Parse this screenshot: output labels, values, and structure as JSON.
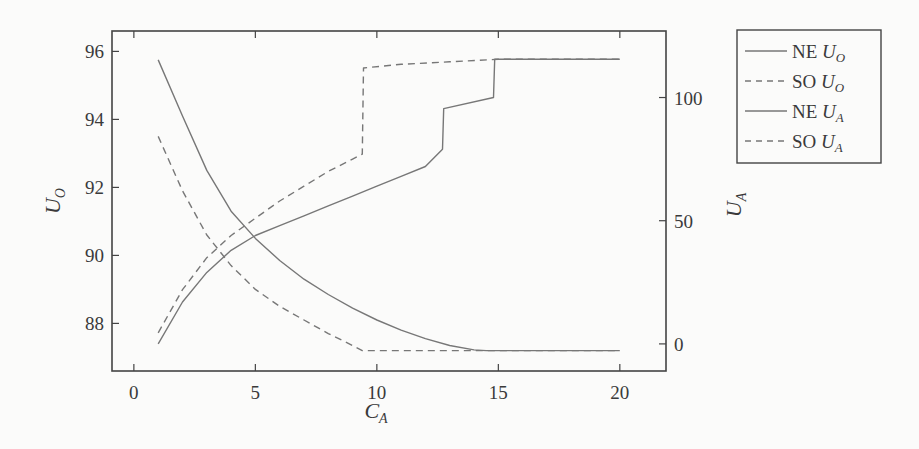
{
  "chart_data": {
    "type": "line",
    "title": "",
    "xlabel": "C_A",
    "ylabel_left": "U_O",
    "ylabel_right": "U_A",
    "xlim": [
      -0.9,
      21.9
    ],
    "ylim_left": [
      86.6,
      96.6
    ],
    "ylim_right": [
      -11,
      127
    ],
    "xticks": [
      0,
      5,
      10,
      15,
      20
    ],
    "yticks_left": [
      88,
      90,
      92,
      94,
      96
    ],
    "yticks_right": [
      0,
      50,
      100
    ],
    "grid": false,
    "legend_position": "outside-right-top",
    "series": [
      {
        "name": "NE U_O",
        "axis": "left",
        "style": "solid",
        "x": [
          1,
          2,
          3,
          4,
          5,
          6,
          7,
          8,
          9,
          10,
          11,
          12,
          13,
          14,
          14.5,
          15,
          16,
          17,
          18,
          19,
          20
        ],
        "y": [
          95.75,
          94.1,
          92.5,
          91.3,
          90.5,
          89.85,
          89.3,
          88.85,
          88.45,
          88.1,
          87.8,
          87.55,
          87.35,
          87.22,
          87.2,
          87.2,
          87.2,
          87.2,
          87.2,
          87.2,
          87.2
        ]
      },
      {
        "name": "SO U_O",
        "axis": "left",
        "style": "dashed",
        "x": [
          1,
          2,
          3,
          4,
          5,
          6,
          7,
          8,
          9,
          9.4,
          10,
          12,
          14,
          15,
          20
        ],
        "y": [
          93.5,
          91.9,
          90.6,
          89.7,
          89.0,
          88.5,
          88.1,
          87.7,
          87.35,
          87.2,
          87.2,
          87.2,
          87.2,
          87.2,
          87.2
        ]
      },
      {
        "name": "NE U_A",
        "axis": "right",
        "style": "solid",
        "x": [
          1,
          2,
          3,
          4,
          5,
          6,
          7,
          8,
          9,
          10,
          11,
          12,
          12.7,
          12.75,
          14.8,
          14.85,
          15,
          20
        ],
        "y": [
          0,
          17,
          29,
          38,
          44,
          48,
          52,
          56,
          60,
          64,
          68,
          72,
          79,
          95.5,
          100,
          115.5,
          115.5,
          115.5
        ]
      },
      {
        "name": "SO U_A",
        "axis": "right",
        "style": "dashed",
        "x": [
          1,
          2,
          3,
          4,
          5,
          6,
          7,
          8,
          9,
          9.4,
          9.45,
          11,
          13,
          15,
          20
        ],
        "y": [
          4.5,
          22,
          35,
          44,
          51,
          58,
          64,
          70,
          75,
          77,
          112,
          113.5,
          114.5,
          115.5,
          115.5
        ]
      }
    ]
  },
  "legend": {
    "items": [
      {
        "label_prefix": "NE ",
        "label_symbol": "U",
        "label_sub": "O",
        "style": "solid"
      },
      {
        "label_prefix": "SO ",
        "label_symbol": "U",
        "label_sub": "O",
        "style": "dashed"
      },
      {
        "label_prefix": "NE ",
        "label_symbol": "U",
        "label_sub": "A",
        "style": "solid"
      },
      {
        "label_prefix": "SO ",
        "label_symbol": "U",
        "label_sub": "A",
        "style": "dashed"
      }
    ]
  },
  "axes": {
    "x_label_main": "C",
    "x_label_sub": "A",
    "left_label_main": "U",
    "left_label_sub": "O",
    "right_label_main": "U",
    "right_label_sub": "A"
  },
  "colors": {
    "line": "#777777",
    "axis": "#444444",
    "background": "#fbfbfa"
  }
}
